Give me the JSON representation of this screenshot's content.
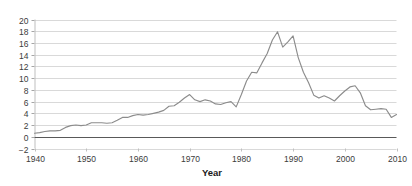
{
  "chart_data": {
    "type": "line",
    "title": "",
    "subtitle": "",
    "xlabel": "Year",
    "ylabel": "",
    "xlim": [
      1940,
      2010
    ],
    "ylim": [
      -2,
      20
    ],
    "grid": true,
    "legend": false,
    "legend_position": "none",
    "line_color": "#8c8c8c",
    "gridline_color": "#d9d9d9",
    "zero_line_color": "#595959",
    "axis_text_color": "#3b3b3b",
    "background_color": "#ffffff",
    "xticks": [
      1940,
      1950,
      1960,
      1970,
      1980,
      1990,
      2000,
      2010
    ],
    "xtick_labels": [
      "1940",
      "1950",
      "1960",
      "1970",
      "1980",
      "1990",
      "2000",
      "2010"
    ],
    "yticks": [
      -2,
      0,
      2,
      4,
      6,
      8,
      10,
      12,
      14,
      16,
      18,
      20
    ],
    "ytick_labels": [
      "−2",
      "0",
      "2",
      "4",
      "6",
      "8",
      "10",
      "12",
      "14",
      "16",
      "18",
      "20"
    ],
    "x": [
      1940,
      1941,
      1942,
      1943,
      1944,
      1945,
      1946,
      1947,
      1948,
      1949,
      1950,
      1951,
      1952,
      1953,
      1954,
      1955,
      1956,
      1957,
      1958,
      1959,
      1960,
      1961,
      1962,
      1963,
      1964,
      1965,
      1966,
      1967,
      1968,
      1969,
      1970,
      1971,
      1972,
      1973,
      1974,
      1975,
      1976,
      1977,
      1978,
      1979,
      1980,
      1981,
      1982,
      1983,
      1984,
      1985,
      1986,
      1987,
      1988,
      1989,
      1990,
      1991,
      1992,
      1993,
      1994,
      1995,
      1996,
      1997,
      1998,
      1999,
      2000,
      2001,
      2002,
      2003,
      2004,
      2005,
      2006,
      2007,
      2008,
      2009,
      2010
    ],
    "values": [
      0.6,
      0.7,
      0.9,
      1.0,
      1.0,
      1.1,
      1.6,
      1.9,
      2.0,
      1.9,
      2.0,
      2.4,
      2.4,
      2.4,
      2.3,
      2.4,
      2.8,
      3.3,
      3.3,
      3.6,
      3.8,
      3.7,
      3.8,
      4.0,
      4.2,
      4.5,
      5.2,
      5.3,
      5.9,
      6.6,
      7.2,
      6.3,
      6.0,
      6.3,
      6.1,
      5.6,
      5.5,
      5.8,
      6.0,
      5.1,
      7.2,
      9.5,
      11.0,
      10.9,
      12.6,
      14.2,
      16.5,
      17.9,
      15.3,
      16.2,
      17.2,
      13.5,
      11.0,
      9.2,
      7.1,
      6.6,
      7.0,
      6.6,
      6.1,
      7.0,
      7.8,
      8.5,
      8.7,
      7.5,
      5.3,
      4.6,
      4.7,
      4.8,
      4.7,
      3.3,
      3.8
    ],
    "series": [
      {
        "name": "series-1",
        "values": [
          0.6,
          0.7,
          0.9,
          1.0,
          1.0,
          1.1,
          1.6,
          1.9,
          2.0,
          1.9,
          2.0,
          2.4,
          2.4,
          2.4,
          2.3,
          2.4,
          2.8,
          3.3,
          3.3,
          3.6,
          3.8,
          3.7,
          3.8,
          4.0,
          4.2,
          4.5,
          5.2,
          5.3,
          5.9,
          6.6,
          7.2,
          6.3,
          6.0,
          6.3,
          6.1,
          5.6,
          5.5,
          5.8,
          6.0,
          5.1,
          7.2,
          9.5,
          11.0,
          10.9,
          12.6,
          14.2,
          16.5,
          17.9,
          15.3,
          16.2,
          17.2,
          13.5,
          11.0,
          9.2,
          7.1,
          6.6,
          7.0,
          6.6,
          6.1,
          7.0,
          7.8,
          8.5,
          8.7,
          7.5,
          5.3,
          4.6,
          4.7,
          4.8,
          4.7,
          3.3,
          3.8
        ],
        "color": "#8c8c8c"
      }
    ]
  }
}
